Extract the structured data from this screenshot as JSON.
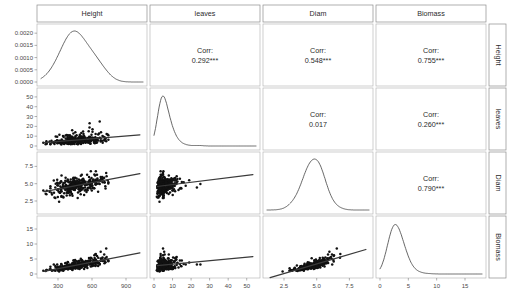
{
  "figure": {
    "type": "scatterplot-matrix",
    "variables": [
      "Height",
      "leaves",
      "Diam",
      "Biomass"
    ],
    "background": "#ffffff",
    "point_color": "#111111",
    "line_color": "#3a3a3a"
  },
  "column_headers": [
    {
      "label": "Height"
    },
    {
      "label": "leaves"
    },
    {
      "label": "Diam"
    },
    {
      "label": "Biomass"
    }
  ],
  "row_labels": [
    {
      "label": "Height"
    },
    {
      "label": "leaves"
    },
    {
      "label": "Diam"
    },
    {
      "label": "Biomass"
    }
  ],
  "correlations": [
    {
      "row": "Height",
      "col": "leaves",
      "prefix": "Corr:",
      "value": "0.292***"
    },
    {
      "row": "Height",
      "col": "Diam",
      "prefix": "Corr:",
      "value": "0.548***"
    },
    {
      "row": "Height",
      "col": "Biomass",
      "prefix": "Corr:",
      "value": "0.755***"
    },
    {
      "row": "leaves",
      "col": "Diam",
      "prefix": "Corr:",
      "value": "0.017"
    },
    {
      "row": "leaves",
      "col": "Biomass",
      "prefix": "Corr:",
      "value": "0.260***"
    },
    {
      "row": "Diam",
      "col": "Biomass",
      "prefix": "Corr:",
      "value": "0.790***"
    }
  ],
  "axes": {
    "y_ticks": {
      "Height": [
        "0.0000",
        "0.0005",
        "0.0010",
        "0.0015",
        "0.0020"
      ],
      "leaves": [
        "0",
        "10",
        "20",
        "30",
        "40",
        "50"
      ],
      "Diam": [
        "2.5",
        "5.0",
        "7.5"
      ],
      "Biomass": [
        "0",
        "5",
        "10",
        "15"
      ]
    },
    "x_ticks": {
      "Height": [
        "300",
        "600",
        "900"
      ],
      "leaves": [
        "0",
        "10",
        "20",
        "30",
        "40",
        "50"
      ],
      "Diam": [
        "2.5",
        "5.0",
        "7.5"
      ],
      "Biomass": [
        "0",
        "5",
        "10",
        "15"
      ]
    }
  },
  "chart_data": {
    "type": "scatter",
    "title": "",
    "xlabel": "",
    "ylabel": "",
    "matrix_layout": "4x4 pairs plot: diagonal = kernel density, lower triangle = scatter with linear fit, upper triangle = Pearson correlation",
    "variables": [
      "Height",
      "leaves",
      "Diam",
      "Biomass"
    ],
    "ranges": {
      "Height": [
        150,
        1050
      ],
      "leaves": [
        0,
        55
      ],
      "Diam": [
        1.2,
        9.0
      ],
      "Biomass": [
        0,
        18
      ]
    },
    "correlation_matrix": {
      "Height_leaves": 0.292,
      "Height_Diam": 0.548,
      "Height_Biomass": 0.755,
      "leaves_Diam": 0.017,
      "leaves_Biomass": 0.26,
      "Diam_Biomass": 0.79
    },
    "significance": {
      "Height_leaves": "***",
      "Height_Diam": "***",
      "Height_Biomass": "***",
      "leaves_Diam": "",
      "leaves_Biomass": "***",
      "Diam_Biomass": "***"
    },
    "densities": {
      "Height": {
        "xlim": [
          150,
          1050
        ],
        "ylim": [
          0,
          0.0021
        ],
        "peak_x": 470,
        "peak_y": 0.00196,
        "shape": "unimodal right-skewed"
      },
      "leaves": {
        "xlim": [
          0,
          55
        ],
        "peak_x": 6,
        "shape": "sharp unimodal right-skewed with small shoulder near 15"
      },
      "Diam": {
        "xlim": [
          1.2,
          9.0
        ],
        "peak_x": 4.6,
        "shape": "unimodal, slight right skew"
      },
      "Biomass": {
        "xlim": [
          0,
          18
        ],
        "peak_x": 3.2,
        "shape": "unimodal right-skewed with small bump near 14"
      }
    },
    "scatter_panels": [
      {
        "x": "Height",
        "y": "leaves",
        "n": 280,
        "fit_slope_sign": "positive"
      },
      {
        "x": "Height",
        "y": "Diam",
        "n": 280,
        "fit_slope_sign": "positive"
      },
      {
        "x": "Height",
        "y": "Biomass",
        "n": 280,
        "fit_slope_sign": "positive"
      },
      {
        "x": "leaves",
        "y": "Diam",
        "n": 280,
        "fit_slope_sign": "flat"
      },
      {
        "x": "leaves",
        "y": "Biomass",
        "n": 280,
        "fit_slope_sign": "positive"
      },
      {
        "x": "Diam",
        "y": "Biomass",
        "n": 280,
        "fit_slope_sign": "positive"
      }
    ],
    "grid": false,
    "legend": "none"
  }
}
